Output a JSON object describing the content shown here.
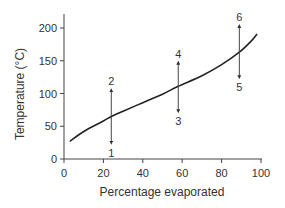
{
  "chart_data": {
    "type": "line",
    "title": "",
    "xlabel": "Percentage evaporated",
    "ylabel": "Temperature (°C)",
    "xlim": [
      0,
      100
    ],
    "ylim": [
      0,
      200
    ],
    "x_ticks": [
      0,
      20,
      40,
      60,
      80,
      100
    ],
    "y_ticks": [
      0,
      50,
      100,
      150,
      200
    ],
    "grid": false,
    "legend": null,
    "series": [
      {
        "name": "Distillation curve",
        "x": [
          3,
          10,
          20,
          24,
          30,
          40,
          50,
          58,
          70,
          80,
          89,
          95,
          98
        ],
        "y": [
          27,
          42,
          58,
          65,
          73,
          86,
          99,
          111,
          127,
          144,
          163,
          180,
          191
        ]
      }
    ],
    "annotations": [
      {
        "label": "1",
        "x": 24,
        "direction": "down",
        "from": 65,
        "to": 25
      },
      {
        "label": "2",
        "x": 24,
        "direction": "up",
        "from": 65,
        "to": 105
      },
      {
        "label": "3",
        "x": 58,
        "direction": "down",
        "from": 111,
        "to": 73
      },
      {
        "label": "4",
        "x": 58,
        "direction": "up",
        "from": 111,
        "to": 147
      },
      {
        "label": "5",
        "x": 89,
        "direction": "down",
        "from": 163,
        "to": 125
      },
      {
        "label": "6",
        "x": 89,
        "direction": "up",
        "from": 163,
        "to": 203
      }
    ]
  }
}
